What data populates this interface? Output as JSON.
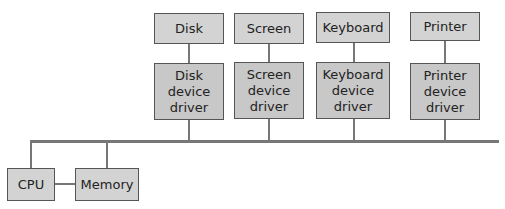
{
  "diagram": {
    "devices": [
      {
        "name": "Disk",
        "driver": "Disk\ndevice\ndriver"
      },
      {
        "name": "Screen",
        "driver": "Screen\ndevice\ndriver"
      },
      {
        "name": "Keyboard",
        "driver": "Keyboard\ndevice\ndriver"
      },
      {
        "name": "Printer",
        "driver": "Printer\ndevice\ndriver"
      }
    ],
    "cpu": "CPU",
    "memory": "Memory",
    "colors": {
      "box": "#d3d3d3",
      "border": "#555555",
      "line": "#777777"
    }
  }
}
